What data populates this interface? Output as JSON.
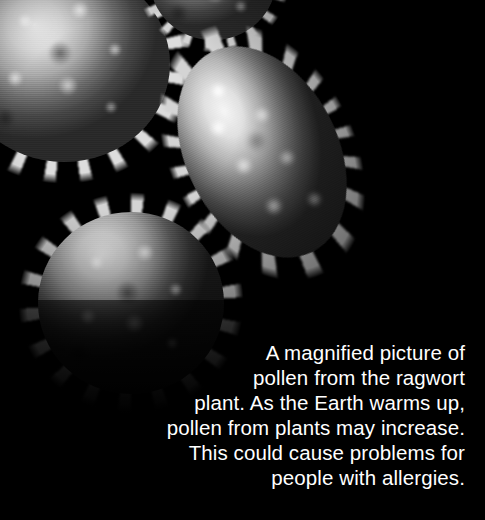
{
  "image": {
    "subject": "scanning electron micrograph of ragwort pollen grains",
    "background_color": "#000000",
    "specimen_color_light": "#ededed",
    "specimen_color_mid": "#9c9c9c",
    "specimen_color_dark": "#2b2b2b",
    "grains": [
      {
        "name": "grain-top-left",
        "shape": "spiky-round",
        "position": "top-left, cropped at left edge"
      },
      {
        "name": "grain-top-edge",
        "shape": "spiky-partial",
        "position": "top edge, cropped"
      },
      {
        "name": "grain-middle-right",
        "shape": "spiky-elongated",
        "position": "upper right, tilted"
      },
      {
        "name": "grain-lower-left",
        "shape": "spiky-round",
        "position": "lower left of centre"
      }
    ]
  },
  "caption": {
    "text_color": "#ffffff",
    "alignment": "right",
    "lines": [
      "A magnified picture of",
      "pollen from the ragwort",
      "plant. As the Earth warms up,",
      "pollen from plants may increase.",
      "This could cause problems for",
      "people with allergies."
    ],
    "full_text": "A magnified picture of pollen from the ragwort plant. As the Earth warms up, pollen from plants may increase. This could cause problems for people with allergies."
  }
}
